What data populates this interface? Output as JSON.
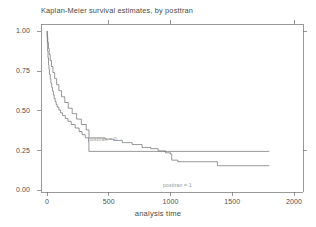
{
  "figure": {
    "title": "Kaplan-Meier survival estimates, by posttran",
    "background": "#ffffff",
    "line_color": "#555555"
  },
  "axes": {
    "x": {
      "label": "analysis time",
      "ticks": [
        "0",
        "500",
        "1000",
        "1500",
        "2000"
      ],
      "min": 0,
      "max": 2080
    },
    "y": {
      "label": "",
      "ticks": [
        "0.00",
        "0.25",
        "0.50",
        "0.75",
        "1.00"
      ],
      "min": 0,
      "max": 1.05
    }
  },
  "annotations": {
    "group0": "posttran = 0",
    "group1": "posttran = 1"
  },
  "chart_data": {
    "type": "line",
    "title": "Kaplan-Meier survival estimates, by posttran",
    "xlabel": "analysis time",
    "ylabel": "",
    "xlim": [
      0,
      2080
    ],
    "ylim": [
      0,
      1.05
    ],
    "grid": false,
    "legend": "inline-annotations",
    "step": "post",
    "series": [
      {
        "name": "posttran = 0",
        "label": "posttran = 0",
        "x": [
          0,
          1,
          2,
          3,
          5,
          8,
          12,
          16,
          20,
          26,
          32,
          38,
          44,
          52,
          58,
          66,
          74,
          82,
          96,
          110,
          126,
          148,
          170,
          196,
          228,
          260,
          284,
          310,
          336,
          339,
          1800
        ],
        "y": [
          1.0,
          0.972,
          0.944,
          0.916,
          0.876,
          0.832,
          0.79,
          0.76,
          0.73,
          0.7,
          0.672,
          0.648,
          0.624,
          0.6,
          0.578,
          0.558,
          0.54,
          0.524,
          0.505,
          0.487,
          0.47,
          0.452,
          0.434,
          0.414,
          0.392,
          0.37,
          0.35,
          0.33,
          0.31,
          0.245,
          0.245
        ]
      },
      {
        "name": "posttran = 1",
        "label": "posttran = 1",
        "x": [
          0,
          2,
          6,
          12,
          18,
          26,
          36,
          48,
          62,
          78,
          96,
          118,
          144,
          172,
          204,
          240,
          278,
          318,
          340,
          400,
          470,
          540,
          610,
          690,
          770,
          840,
          900,
          960,
          1000,
          1010,
          1060,
          1380,
          1800
        ],
        "y": [
          1.0,
          0.966,
          0.93,
          0.892,
          0.854,
          0.816,
          0.778,
          0.74,
          0.702,
          0.664,
          0.626,
          0.588,
          0.552,
          0.516,
          0.482,
          0.448,
          0.414,
          0.38,
          0.33,
          0.33,
          0.322,
          0.314,
          0.3,
          0.288,
          0.27,
          0.262,
          0.248,
          0.236,
          0.228,
          0.19,
          0.18,
          0.155,
          0.155
        ]
      }
    ]
  }
}
